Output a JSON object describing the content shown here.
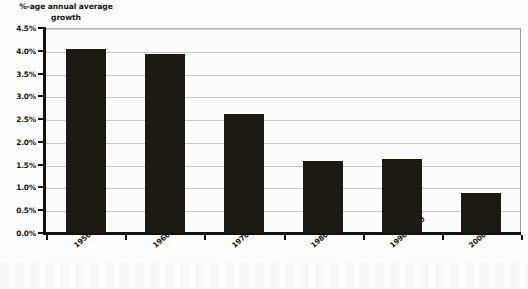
{
  "chart_data": {
    "type": "bar",
    "title": "%-age annual average growth",
    "title_line1": "%-age annual average",
    "title_line2": "growth",
    "xlabel": "",
    "ylabel": "",
    "categories": [
      "1950–60",
      "1960–70",
      "1970–80",
      "1980–90",
      "1990–2000",
      "2000–03"
    ],
    "values": [
      4.05,
      3.92,
      2.62,
      1.57,
      1.63,
      0.87
    ],
    "ylim": [
      0,
      4.5
    ],
    "ytick_values": [
      0.0,
      0.5,
      1.0,
      1.5,
      2.0,
      2.5,
      3.0,
      3.5,
      4.0,
      4.5
    ],
    "ytick_labels": [
      "0.0%",
      "0.5%",
      "1.0%",
      "1.5%",
      "2.0%",
      "2.5%",
      "3.0%",
      "3.5%",
      "4.0%",
      "4.5%"
    ],
    "grid": true,
    "legend": false,
    "bar_color": "#1d1a11",
    "gridline_color": "#c9c9c5",
    "axis_color": "#141210",
    "background_color": "#fcfcfa"
  }
}
